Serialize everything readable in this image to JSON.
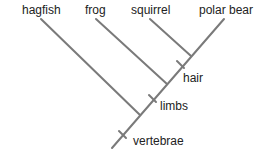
{
  "diagram": {
    "type": "cladogram",
    "line_color": "#7a7a7a",
    "taxa": [
      {
        "label": "hagfish"
      },
      {
        "label": "frog"
      },
      {
        "label": "squirrel"
      },
      {
        "label": "polar bear"
      }
    ],
    "traits": [
      {
        "label": "vertebrae"
      },
      {
        "label": "limbs"
      },
      {
        "label": "hair"
      }
    ]
  }
}
